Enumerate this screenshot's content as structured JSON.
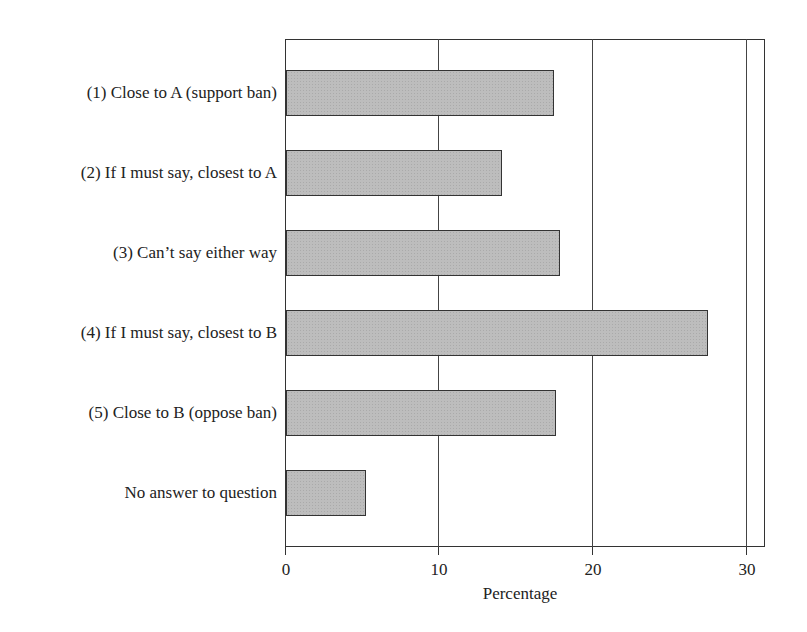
{
  "chart_data": {
    "type": "bar",
    "orientation": "horizontal",
    "title": "",
    "xlabel": "Percentage",
    "ylabel": "",
    "categories": [
      "(1) Close to A (support ban)",
      "(2)  If I must say, closest to A",
      "(3) Can’t say either way",
      "(4) If I must say, closest to B",
      "(5) Close to B (oppose ban)",
      "No answer to question"
    ],
    "values": [
      17.4,
      14.0,
      17.8,
      27.4,
      17.5,
      5.2
    ],
    "xlim": [
      0,
      31.3
    ],
    "xticks": [
      0,
      10,
      20,
      30
    ],
    "xtick_labels": [
      "0",
      "10",
      "20",
      "30"
    ],
    "grid": {
      "vertical": true,
      "at": [
        10,
        20,
        30
      ]
    },
    "legend": null,
    "bar_color": "#bdbdbd"
  },
  "axis": {
    "x_label": "Percentage",
    "tick_labels": [
      "0",
      "10",
      "20",
      "30"
    ]
  },
  "categories": [
    {
      "label": "(1) Close to A (support ban)",
      "value": 17.4
    },
    {
      "label": "(2)  If I must say, closest to A",
      "value": 14.0
    },
    {
      "label": "(3) Can’t say either way",
      "value": 17.8
    },
    {
      "label": "(4) If I must say, closest to B",
      "value": 27.4
    },
    {
      "label": "(5) Close to B (oppose ban)",
      "value": 17.5
    },
    {
      "label": "No answer to question",
      "value": 5.2
    }
  ]
}
